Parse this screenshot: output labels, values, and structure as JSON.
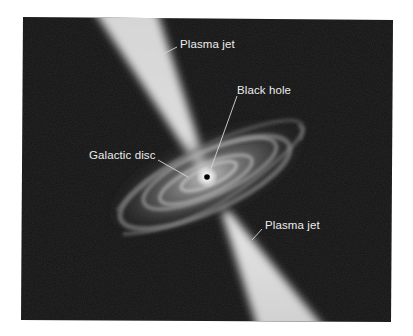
{
  "diagram": {
    "background_color": "#141414",
    "page_color": "#ffffff",
    "labels": [
      {
        "id": "plasma-jet-top",
        "text": "Plasma jet"
      },
      {
        "id": "black-hole",
        "text": "Black hole"
      },
      {
        "id": "galactic-disc",
        "text": "Galactic disc"
      },
      {
        "id": "plasma-jet-bottom",
        "text": "Plasma jet"
      }
    ],
    "components": [
      {
        "name": "Black hole",
        "color": "#000000"
      },
      {
        "name": "Galactic disc",
        "color": "#b8b8b8"
      },
      {
        "name": "Plasma jet (upper)",
        "color": "#d4d4d4"
      },
      {
        "name": "Plasma jet (lower)",
        "color": "#d4d4d4"
      }
    ]
  }
}
